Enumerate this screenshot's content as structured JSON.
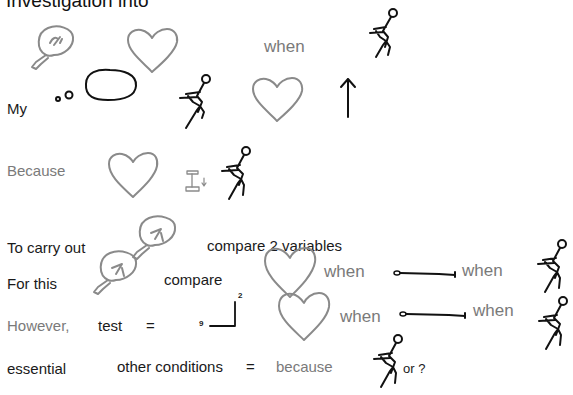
{
  "slide": {
    "title": "Investigation into",
    "colors": {
      "text_dark": "#1a1a1a",
      "text_grey": "#7a7a7a",
      "sketch_grey": "#8a8a8a",
      "sketch_black": "#111111",
      "background": "#ffffff"
    }
  },
  "rows": {
    "row1": {
      "label": "My",
      "word_when": "when"
    },
    "row2": {
      "label": "Because"
    },
    "row3": {
      "label": "To carry out",
      "text": "compare 2 variables"
    },
    "row4": {
      "label": "For this",
      "text": "compare",
      "when_a": "when",
      "when_b": "when"
    },
    "row5": {
      "label": "However,",
      "test": "test",
      "equals": "=",
      "axis_y": "2",
      "axis_x": "9",
      "when_a": "when",
      "when_b": "when"
    },
    "row6": {
      "label": "essential",
      "text": "other conditions",
      "equals": "=",
      "because": "because",
      "or": "or ?"
    }
  },
  "icons": {
    "brain": "brain-icon",
    "heart": "heart-icon",
    "thought_bubble": "thought-bubble-icon",
    "stick_figure": "running-figure-icon",
    "up_arrow": "up-arrow-icon",
    "weight": "weight-icon",
    "long_arrow": "long-arrow-icon",
    "axes": "graph-axes-icon"
  }
}
